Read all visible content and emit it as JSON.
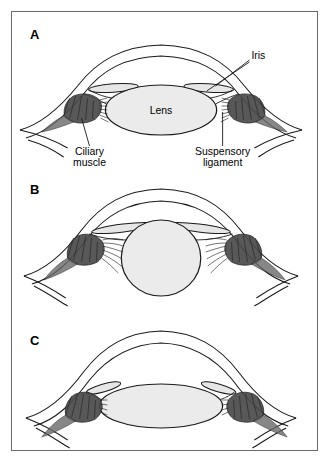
{
  "figure": {
    "border_color": "#6a6a6a",
    "background": "#ffffff",
    "line_color": "#1a1a1a",
    "lens_fill": "#ebebeb",
    "iris_fill": "#e0e0e0",
    "muscle_fill": "#555555"
  },
  "panels": [
    {
      "id": "A",
      "letter": "A",
      "state_description": "Relaxed ciliary muscle, taut suspensory ligament, flattened wide lens",
      "labels": [
        {
          "name": "iris",
          "text": "Iris",
          "lines": [
            "Iris"
          ]
        },
        {
          "name": "lens",
          "text": "Lens",
          "lines": [
            "Lens"
          ]
        },
        {
          "name": "ciliary-muscle",
          "text": "Ciliary muscle",
          "lines": [
            "Ciliary",
            "muscle"
          ]
        },
        {
          "name": "suspensory-ligament",
          "text": "Suspensory ligament",
          "lines": [
            "Suspensory",
            "ligament"
          ]
        }
      ]
    },
    {
      "id": "B",
      "letter": "B",
      "state_description": "Contracted ciliary muscle, slack suspensory ligament, rounded spherical lens",
      "labels": []
    },
    {
      "id": "C",
      "letter": "C",
      "state_description": "Flattened lens with widened iris aperture",
      "labels": []
    }
  ],
  "caption": {
    "partial_text": ""
  }
}
